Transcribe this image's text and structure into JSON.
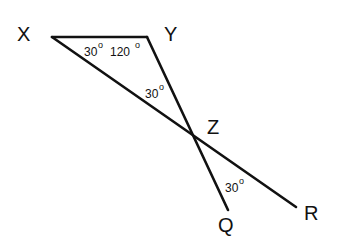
{
  "diagram": {
    "points": {
      "X": "X",
      "Y": "Y",
      "Z": "Z",
      "Q": "Q",
      "R": "R"
    },
    "angles": {
      "at_X": "30",
      "at_Y": "120",
      "at_Z_triangle": "30",
      "at_Z_QR": "30",
      "degree_symbol": "o"
    },
    "segments": [
      "XY",
      "XR",
      "YQ"
    ]
  }
}
